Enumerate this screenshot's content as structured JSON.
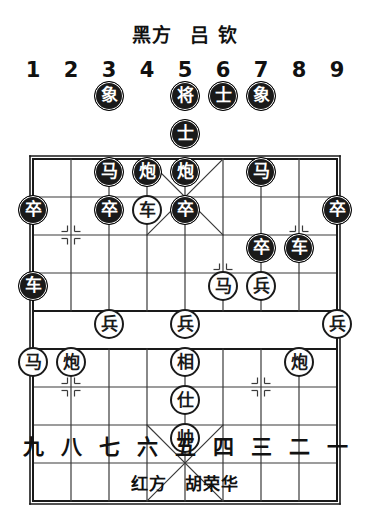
{
  "header": {
    "side_label": "黑方",
    "player_name": "吕 钦"
  },
  "footer": {
    "side_label": "红方",
    "player_name": "胡荣华"
  },
  "board": {
    "files_top": [
      "1",
      "2",
      "3",
      "4",
      "5",
      "6",
      "7",
      "8",
      "9"
    ],
    "files_bottom": [
      "九",
      "八",
      "七",
      "六",
      "五",
      "四",
      "三",
      "二",
      "一"
    ],
    "columns": 9,
    "rows": 10,
    "cell_size": 38,
    "origin_x": 33,
    "origin_y": 96,
    "colors": {
      "line": "#3a3a3a",
      "border": "#1a1a1a",
      "black_piece_bg": "#1a1a1a",
      "black_piece_text": "#ffffff",
      "red_piece_bg": "#ffffff",
      "red_piece_text": "#1a1a1a"
    }
  },
  "pieces": [
    {
      "name": "black-elephant-file3",
      "label": "象",
      "side": "black",
      "col": 3,
      "row": 1
    },
    {
      "name": "black-general-file5",
      "label": "将",
      "side": "black",
      "col": 5,
      "row": 1
    },
    {
      "name": "black-advisor-file6",
      "label": "士",
      "side": "black",
      "col": 6,
      "row": 1
    },
    {
      "name": "black-elephant-file7",
      "label": "象",
      "side": "black",
      "col": 7,
      "row": 1
    },
    {
      "name": "black-advisor-file5",
      "label": "士",
      "side": "black",
      "col": 5,
      "row": 2
    },
    {
      "name": "black-horse-file3",
      "label": "马",
      "side": "black",
      "col": 3,
      "row": 3
    },
    {
      "name": "black-cannon-file4",
      "label": "炮",
      "side": "black",
      "col": 4,
      "row": 3
    },
    {
      "name": "black-cannon-file5",
      "label": "炮",
      "side": "black",
      "col": 5,
      "row": 3
    },
    {
      "name": "black-horse-file7",
      "label": "马",
      "side": "black",
      "col": 7,
      "row": 3
    },
    {
      "name": "black-pawn-file1",
      "label": "卒",
      "side": "black",
      "col": 1,
      "row": 4
    },
    {
      "name": "black-pawn-file3",
      "label": "卒",
      "side": "black",
      "col": 3,
      "row": 4
    },
    {
      "name": "red-chariot-file4",
      "label": "车",
      "side": "red",
      "col": 4,
      "row": 4
    },
    {
      "name": "black-pawn-file5",
      "label": "卒",
      "side": "black",
      "col": 5,
      "row": 4
    },
    {
      "name": "black-pawn-file9",
      "label": "卒",
      "side": "black",
      "col": 9,
      "row": 4
    },
    {
      "name": "black-pawn-file7",
      "label": "卒",
      "side": "black",
      "col": 7,
      "row": 5
    },
    {
      "name": "black-chariot-file8",
      "label": "车",
      "side": "black",
      "col": 8,
      "row": 5
    },
    {
      "name": "black-chariot-file1",
      "label": "车",
      "side": "black",
      "col": 1,
      "row": 6
    },
    {
      "name": "red-horse-file6",
      "label": "马",
      "side": "red",
      "col": 6,
      "row": 6
    },
    {
      "name": "red-pawn-file7",
      "label": "兵",
      "side": "red",
      "col": 7,
      "row": 6
    },
    {
      "name": "red-pawn-file3",
      "label": "兵",
      "side": "red",
      "col": 3,
      "row": 7
    },
    {
      "name": "red-pawn-file5",
      "label": "兵",
      "side": "red",
      "col": 5,
      "row": 7
    },
    {
      "name": "red-pawn-file9",
      "label": "兵",
      "side": "red",
      "col": 9,
      "row": 7
    },
    {
      "name": "red-horse-file1",
      "label": "马",
      "side": "red",
      "col": 1,
      "row": 8
    },
    {
      "name": "red-cannon-file2",
      "label": "炮",
      "side": "red",
      "col": 2,
      "row": 8
    },
    {
      "name": "red-elephant-file5",
      "label": "相",
      "side": "red",
      "col": 5,
      "row": 8
    },
    {
      "name": "red-cannon-file8",
      "label": "炮",
      "side": "red",
      "col": 8,
      "row": 8
    },
    {
      "name": "red-advisor-file5",
      "label": "仕",
      "side": "red",
      "col": 5,
      "row": 9
    },
    {
      "name": "red-general-file5",
      "label": "帅",
      "side": "red",
      "col": 5,
      "row": 10
    }
  ],
  "star_points": [
    {
      "name": "star-point-black-left-pawn",
      "col": 2,
      "row": 3
    },
    {
      "name": "star-point-black-right-pawn",
      "col": 8,
      "row": 3
    },
    {
      "name": "star-point-black-mid-file6",
      "col": 6,
      "row": 4
    },
    {
      "name": "star-point-red-left-pawn",
      "col": 2,
      "row": 7
    },
    {
      "name": "star-point-red-mid-file7",
      "col": 7,
      "row": 7
    }
  ]
}
